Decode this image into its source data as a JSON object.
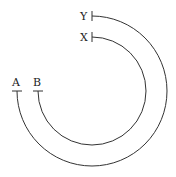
{
  "diagram": {
    "center": [
      92,
      91
    ],
    "arcs": [
      {
        "name": "outer",
        "radius": 75,
        "start_label": "Y",
        "end_label": "A"
      },
      {
        "name": "inner",
        "radius": 54,
        "start_label": "X",
        "end_label": "B"
      }
    ],
    "labels": {
      "Y": "Y",
      "X": "X",
      "A": "A",
      "B": "B"
    },
    "stroke_color": "#333333"
  }
}
